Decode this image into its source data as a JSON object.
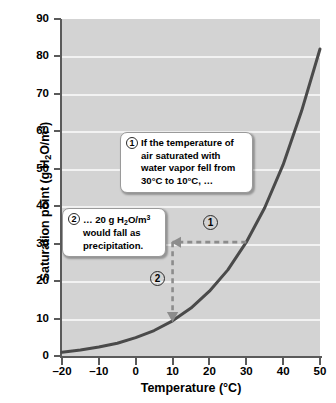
{
  "chart_data": {
    "type": "line",
    "title": "",
    "xlabel": "Temperature (°C)",
    "ylabel": "Saturation point (g H2O/m3)",
    "xlim": [
      -20,
      50
    ],
    "ylim": [
      0,
      90
    ],
    "xticks": [
      -20,
      -10,
      0,
      10,
      20,
      30,
      40,
      50
    ],
    "yticks": [
      0,
      10,
      20,
      30,
      40,
      50,
      60,
      70,
      80,
      90
    ],
    "xtick_labels": [
      "–20",
      "–10",
      "0",
      "10",
      "20",
      "30",
      "40",
      "50"
    ],
    "ytick_labels": [
      "0",
      "10",
      "20",
      "30",
      "40",
      "50",
      "60",
      "70",
      "80",
      "90"
    ],
    "grid": "horizontal",
    "legend": "none",
    "series": [
      {
        "name": "Saturation point",
        "x": [
          -20,
          -15,
          -10,
          -5,
          0,
          5,
          10,
          15,
          20,
          25,
          30,
          35,
          40,
          45,
          50
        ],
        "values": [
          1.0,
          1.6,
          2.4,
          3.4,
          4.9,
          6.8,
          9.4,
          12.8,
          17.3,
          23.0,
          30.4,
          39.6,
          51.1,
          65.4,
          82.0
        ]
      }
    ],
    "annotations": [
      {
        "id": "1",
        "kind": "arrow",
        "style": "dashed",
        "from": [
          30,
          30.4
        ],
        "to": [
          10,
          30.4
        ],
        "direction": "horizontal-left"
      },
      {
        "id": "2",
        "kind": "arrow",
        "style": "dashed",
        "from": [
          10,
          30.4
        ],
        "to": [
          10,
          9.4
        ],
        "direction": "vertical-down"
      }
    ]
  },
  "axes": {
    "y_title_parts": {
      "lead": "Saturation point (g H",
      "sub": "2",
      "mid": "O/m",
      "sup": "3",
      "tail": ")"
    },
    "x_title": "Temperature (°C)"
  },
  "callouts": [
    {
      "id": "callout-1",
      "badge": "1",
      "text": "If the temperature of air saturated with water vapor fell from 30°C to 10°C, …"
    },
    {
      "id": "callout-2",
      "badge": "2",
      "text_lead": "… 20 g H",
      "text_sub": "2",
      "text_mid": "O/m",
      "text_sup": "3",
      "text_tail": " would fall as precipitation."
    }
  ],
  "markers": [
    {
      "id": "marker-1",
      "label": "1"
    },
    {
      "id": "marker-2",
      "label": "2"
    }
  ],
  "colors": {
    "plot_background": "#d3d3d3",
    "gridline": "#f2f2f2",
    "curve": "#4a4a4a",
    "axis": "#5a5a5a",
    "annotation_arrow": "#8c8c8c",
    "callout_background": "#ffffff",
    "callout_border": "#9a9a9a",
    "text": "#000000"
  }
}
